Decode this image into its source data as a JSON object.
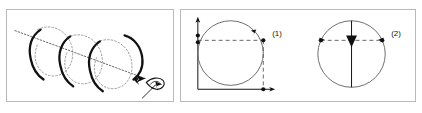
{
  "figure": {
    "background_color": "#ffffff",
    "frame_color": "#b9b9b9",
    "ink_color": "#111111",
    "faint_color": "#888888"
  },
  "panels": [
    {
      "name": "helix-panel",
      "caption": "",
      "description": "Helix (coil/spiral) drawn around a dotted diagonal axis with a directional arrow and a hand-sketched marker at the lower right end",
      "elements": {
        "axis_label": "",
        "rotation_arrow": "",
        "sketch_marker": ""
      }
    },
    {
      "name": "circles-panel",
      "caption": "",
      "circles": [
        {
          "label": "(1)",
          "name": "circle-one",
          "has_vertical_axis": true,
          "has_horizontal_axis": true,
          "has_dashed_horizontal_chord": true,
          "has_dashed_vertical_chord": true,
          "has_center_line": false,
          "has_center_arrow": false,
          "dot_count": 5
        },
        {
          "label": "(2)",
          "name": "circle-two",
          "has_vertical_axis": false,
          "has_horizontal_axis": false,
          "has_dashed_horizontal_chord": true,
          "has_dashed_vertical_chord": false,
          "has_center_line": true,
          "has_center_arrow": true,
          "dot_count": 3
        }
      ]
    }
  ],
  "labels": {
    "circle_one": "(1)",
    "circle_two": "(2)"
  }
}
